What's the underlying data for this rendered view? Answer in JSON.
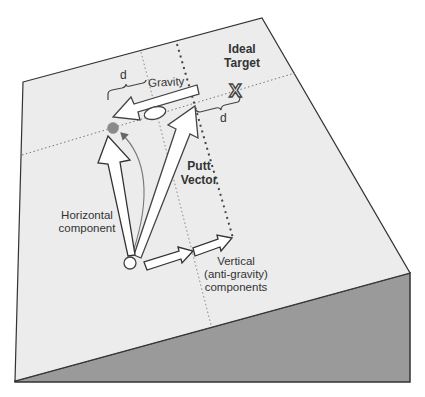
{
  "diagram": {
    "type": "putting-on-slope-vector-diagram",
    "colors": {
      "plane": "#ececec",
      "slope_side": "#9a9a9a",
      "outline": "#333333",
      "arrow_fill": "#ffffff",
      "ball_gray": "#8a8a8a",
      "dotted": "#777777",
      "text": "#333333"
    }
  },
  "labels": {
    "ideal_target_line1": "Ideal",
    "ideal_target_line2": "Target",
    "target_marker": "X",
    "gravity": "Gravity",
    "d_left": "d",
    "d_right": "d",
    "putt_vector_line1": "Putt",
    "putt_vector_line2": "Vector",
    "horizontal_line1": "Horizontal",
    "horizontal_line2": "component",
    "vertical_line1": "Vertical",
    "vertical_line2": "(anti-gravity)",
    "vertical_line3": "components"
  }
}
